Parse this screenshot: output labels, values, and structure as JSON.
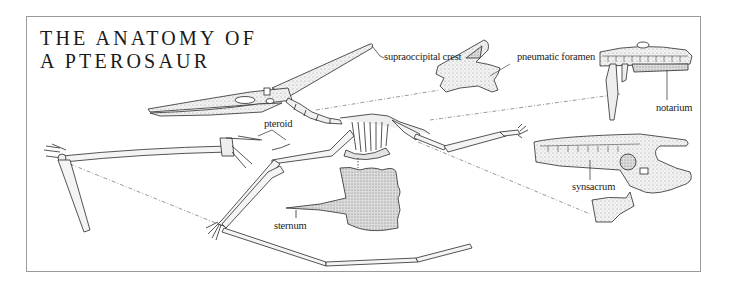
{
  "title": {
    "line1": "THE ANATOMY OF",
    "line2": "A PTEROSAUR"
  },
  "labels": {
    "supraoccipital_crest": "supraoccipital crest",
    "pneumatic_foramen": "pneumatic foramen",
    "notarium": "notarium",
    "pteroid": "pteroid",
    "sternum": "sternum",
    "synsacrum": "synsacrum"
  },
  "colors": {
    "ink": "#2a2a2a",
    "frame": "#9a9a9a",
    "bone_shade": "#d9d9d9",
    "background": "#ffffff"
  }
}
